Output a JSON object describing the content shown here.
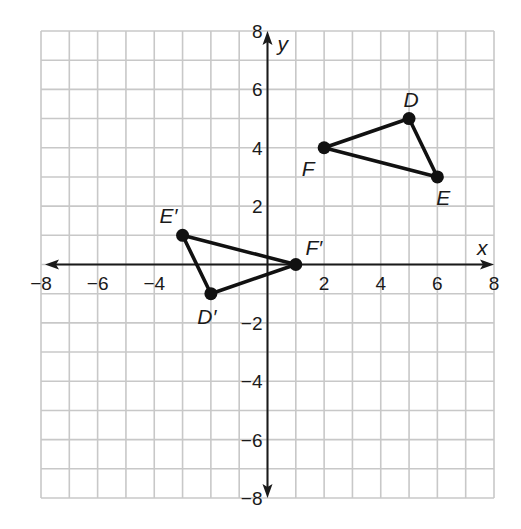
{
  "diagram": {
    "type": "coordinate-plane",
    "x_axis_label": "x",
    "y_axis_label": "y",
    "x_range": [
      -8,
      8
    ],
    "y_range": [
      -8,
      8
    ],
    "grid_step": 1,
    "tick_step": 2,
    "x_ticks": [
      "−8",
      "−6",
      "−4",
      "2",
      "4",
      "6",
      "8"
    ],
    "y_ticks": [
      "8",
      "6",
      "4",
      "2",
      "−2",
      "−4",
      "−6",
      "−8"
    ],
    "colors": {
      "grid": "#c8c8c8",
      "axes": "#1a1a1a",
      "shapes": "#111111"
    }
  },
  "triangles": [
    {
      "name": "DEF",
      "vertices": [
        {
          "label": "D",
          "x": 5,
          "y": 5
        },
        {
          "label": "E",
          "x": 6,
          "y": 3
        },
        {
          "label": "F",
          "x": 2,
          "y": 4
        }
      ]
    },
    {
      "name": "D'E'F'",
      "vertices": [
        {
          "label": "D′",
          "x": -2,
          "y": -1
        },
        {
          "label": "E′",
          "x": -3,
          "y": 1
        },
        {
          "label": "F′",
          "x": 1,
          "y": 0
        }
      ]
    }
  ]
}
